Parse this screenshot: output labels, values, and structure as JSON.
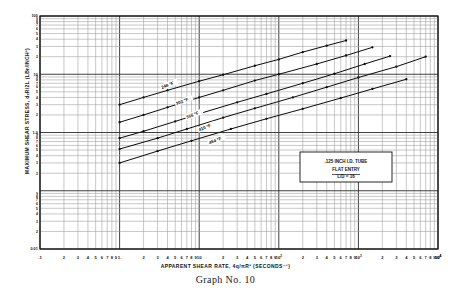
{
  "caption": "Graph No. 10",
  "axes": {
    "xlabel_text": "APPARENT SHEAR RATE, 4q/πR³  (SECONDS⁻¹)",
    "ylabel_text": "MAXIMUM SHEAR STRESS,  dᵥR/2L (LBғ/INCH²)",
    "x_decade_labels": [
      ".1",
      "1.",
      "10",
      "10²",
      "10³",
      "10⁴"
    ],
    "x_minor_labels": [
      "2",
      "3",
      "4",
      "5",
      "6",
      "7",
      "8",
      "9"
    ],
    "y_decade_labels": [
      "100",
      "10",
      "1.0",
      "0.01"
    ],
    "y_minor_labels": [
      "2",
      "3",
      "4",
      "5",
      "6",
      "7",
      "8",
      "9"
    ]
  },
  "annotation": {
    "line1": ".125 INCH I.D. TUBE",
    "line2": "FLAT ENTRY",
    "line3": "L/D = 16"
  },
  "chart_data": {
    "type": "line",
    "title": "Graph No. 10",
    "xlabel": "APPARENT SHEAR RATE, 4q/πR³ (SECONDS⁻¹)",
    "ylabel": "MAXIMUM SHEAR STRESS, dᵥR/2L (LBғ/INCH²)",
    "xscale": "log",
    "yscale": "log",
    "xlim": [
      0.1,
      10000
    ],
    "ylim": [
      0.01,
      100
    ],
    "grid": true,
    "legend": "inline-curve-labels",
    "series": [
      {
        "name": "248 °F",
        "label": "248 °F",
        "x": [
          1.0,
          2.0,
          4.0,
          10.0,
          20.0,
          50.0,
          100.0,
          200.0,
          400.0,
          700.0
        ],
        "y": [
          3.0,
          4.0,
          5.3,
          7.6,
          9.8,
          14.0,
          18.0,
          24.0,
          31.0,
          38.0
        ]
      },
      {
        "name": "302 °F",
        "label": "302 °F",
        "x": [
          1.0,
          2.0,
          4.0,
          10.0,
          20.0,
          50.0,
          100.0,
          300.0,
          700.0,
          1500.0
        ],
        "y": [
          1.5,
          2.0,
          2.7,
          4.0,
          5.3,
          7.8,
          10.0,
          15.0,
          21.0,
          29.0
        ]
      },
      {
        "name": "356 °F",
        "label": "356 °F",
        "x": [
          1.0,
          2.0,
          5.0,
          10.0,
          30.0,
          70.0,
          200.0,
          500.0,
          1200.0,
          2500.0
        ],
        "y": [
          0.8,
          1.05,
          1.55,
          2.1,
          3.3,
          4.6,
          7.0,
          10.2,
          15.0,
          20.5
        ]
      },
      {
        "name": "410 °F",
        "label": "410 °F",
        "x": [
          1.0,
          3.0,
          7.0,
          20.0,
          50.0,
          150.0,
          400.0,
          1000.0,
          3000.0,
          7000.0
        ],
        "y": [
          0.52,
          0.8,
          1.15,
          1.8,
          2.6,
          4.0,
          6.0,
          8.8,
          13.5,
          20.0
        ]
      },
      {
        "name": "464 °F",
        "label": "464 °F",
        "x": [
          1.0,
          3.0,
          8.0,
          25.0,
          70.0,
          200.0,
          600.0,
          1500.0,
          4000.0
        ],
        "y": [
          0.3,
          0.48,
          0.72,
          1.15,
          1.72,
          2.55,
          3.9,
          5.6,
          8.2
        ]
      }
    ],
    "curve_labels": [
      "248 °F",
      "302 °F",
      "356 °F",
      "410 °F",
      "464 °F"
    ],
    "annotation_text": ".125 INCH I.D. TUBE / FLAT ENTRY / L/D = 16"
  }
}
